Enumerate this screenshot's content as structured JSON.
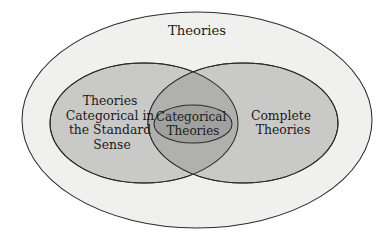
{
  "diagram": {
    "type": "venn",
    "title_visible": false,
    "background_color": "#ffffff",
    "stroke_color": "#2b2b2b",
    "sets": {
      "universe": {
        "label": "Theories",
        "label_lines": [
          "Theories"
        ],
        "fill_color": "#f0f0ee",
        "geometry": {
          "cx": 197,
          "cy": 120,
          "rx": 175,
          "ry": 108
        },
        "label_position": {
          "x": 197,
          "y": 31
        }
      },
      "left": {
        "label": "Theories Categorical in the Standard Sense",
        "label_lines": [
          "Theories",
          "Categorical in",
          "the Standard",
          "Sense"
        ],
        "fill_color": "#c9c9c7",
        "geometry": {
          "cx": 144,
          "cy": 123,
          "rx": 94,
          "ry": 60
        },
        "label_position": {
          "x": 112,
          "y": 123
        }
      },
      "right": {
        "label": "Complete Theories",
        "label_lines": [
          "Complete",
          "Theories"
        ],
        "fill_color": "#c9c9c7",
        "geometry": {
          "cx": 243,
          "cy": 123,
          "rx": 95,
          "ry": 60
        },
        "label_position": {
          "x": 283,
          "y": 123
        }
      },
      "intersection": {
        "label": "",
        "fill_color": "#b0b0ae"
      },
      "inner": {
        "label": "Categorical Theories",
        "label_lines": [
          "Categorical",
          "Theories"
        ],
        "fill_color": "#a0a09e",
        "geometry": {
          "cx": 193,
          "cy": 124,
          "rx": 39,
          "ry": 19
        },
        "label_position": {
          "x": 193,
          "y": 124
        }
      }
    }
  }
}
